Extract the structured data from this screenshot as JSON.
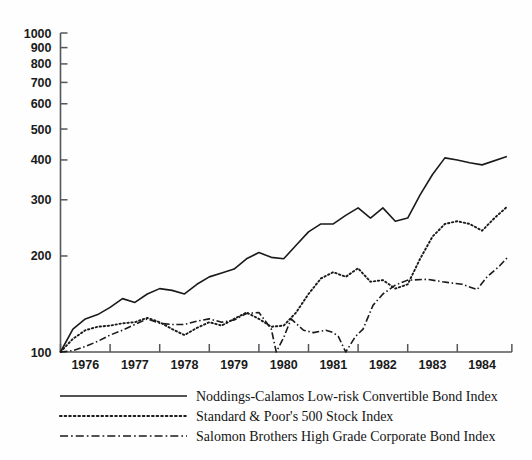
{
  "chart_data": {
    "type": "line",
    "title": "",
    "xlabel": "",
    "ylabel": "",
    "yscale": "log",
    "ylim": [
      100,
      1000
    ],
    "xlim": [
      1975.5,
      1984.6
    ],
    "grid": false,
    "legend_position": "below",
    "ytick_labels": [
      "1000",
      "900",
      "800",
      "700",
      "600",
      "500",
      "400",
      "300",
      "200",
      "100"
    ],
    "ytick_values": [
      1000,
      900,
      800,
      700,
      600,
      500,
      400,
      300,
      200,
      100
    ],
    "xtick_labels": [
      "1976",
      "1977",
      "1978",
      "1979",
      "1980",
      "1981",
      "1982",
      "1983",
      "1984"
    ],
    "xtick_values": [
      1976,
      1977,
      1978,
      1979,
      1980,
      1981,
      1982,
      1983,
      1984
    ],
    "series": [
      {
        "name": "Noddings-Calamos Low-risk Convertible Bond Index",
        "style": "solid",
        "color": "#1a1a1a",
        "points": [
          [
            1975.5,
            100
          ],
          [
            1975.75,
            118
          ],
          [
            1976.0,
            127
          ],
          [
            1976.25,
            131
          ],
          [
            1976.5,
            138
          ],
          [
            1976.75,
            147
          ],
          [
            1977.0,
            143
          ],
          [
            1977.25,
            152
          ],
          [
            1977.5,
            158
          ],
          [
            1977.75,
            156
          ],
          [
            1978.0,
            152
          ],
          [
            1978.25,
            163
          ],
          [
            1978.5,
            172
          ],
          [
            1978.75,
            177
          ],
          [
            1979.0,
            182
          ],
          [
            1979.25,
            196
          ],
          [
            1979.5,
            205
          ],
          [
            1979.75,
            198
          ],
          [
            1980.0,
            196
          ],
          [
            1980.25,
            216
          ],
          [
            1980.5,
            238
          ],
          [
            1980.75,
            252
          ],
          [
            1981.0,
            252
          ],
          [
            1981.25,
            268
          ],
          [
            1981.5,
            283
          ],
          [
            1981.75,
            263
          ],
          [
            1982.0,
            283
          ],
          [
            1982.25,
            257
          ],
          [
            1982.5,
            263
          ],
          [
            1982.75,
            311
          ],
          [
            1983.0,
            360
          ],
          [
            1983.25,
            406
          ],
          [
            1983.5,
            400
          ],
          [
            1983.75,
            392
          ],
          [
            1984.0,
            386
          ],
          [
            1984.5,
            410
          ]
        ]
      },
      {
        "name": "Standard & Poor's 500 Stock Index",
        "style": "dotted",
        "color": "#1a1a1a",
        "points": [
          [
            1975.5,
            100
          ],
          [
            1975.75,
            110
          ],
          [
            1976.0,
            117
          ],
          [
            1976.25,
            120
          ],
          [
            1976.5,
            121
          ],
          [
            1976.75,
            123
          ],
          [
            1977.0,
            124
          ],
          [
            1977.25,
            128
          ],
          [
            1977.5,
            124
          ],
          [
            1977.75,
            118
          ],
          [
            1978.0,
            113
          ],
          [
            1978.25,
            119
          ],
          [
            1978.5,
            124
          ],
          [
            1978.75,
            121
          ],
          [
            1979.0,
            127
          ],
          [
            1979.25,
            133
          ],
          [
            1979.5,
            127
          ],
          [
            1979.75,
            120
          ],
          [
            1980.0,
            121
          ],
          [
            1980.25,
            133
          ],
          [
            1980.5,
            152
          ],
          [
            1980.75,
            170
          ],
          [
            1981.0,
            178
          ],
          [
            1981.25,
            172
          ],
          [
            1981.5,
            183
          ],
          [
            1981.75,
            166
          ],
          [
            1982.0,
            168
          ],
          [
            1982.25,
            158
          ],
          [
            1982.5,
            163
          ],
          [
            1982.75,
            196
          ],
          [
            1983.0,
            230
          ],
          [
            1983.25,
            252
          ],
          [
            1983.5,
            257
          ],
          [
            1983.75,
            252
          ],
          [
            1984.0,
            240
          ],
          [
            1984.25,
            263
          ],
          [
            1984.5,
            285
          ]
        ]
      },
      {
        "name": "Salomon Brothers High Grade Corporate Bond Index",
        "style": "dashdot",
        "color": "#1a1a1a",
        "points": [
          [
            1975.5,
            100
          ],
          [
            1975.75,
            101
          ],
          [
            1976.0,
            104
          ],
          [
            1976.25,
            108
          ],
          [
            1976.5,
            113
          ],
          [
            1976.75,
            117
          ],
          [
            1977.0,
            122
          ],
          [
            1977.25,
            127
          ],
          [
            1977.5,
            123
          ],
          [
            1977.75,
            122
          ],
          [
            1978.0,
            122
          ],
          [
            1978.25,
            125
          ],
          [
            1978.5,
            127
          ],
          [
            1978.75,
            124
          ],
          [
            1979.0,
            126
          ],
          [
            1979.25,
            132
          ],
          [
            1979.5,
            133
          ],
          [
            1979.75,
            118
          ],
          [
            1979.85,
            100
          ],
          [
            1980.0,
            111
          ],
          [
            1980.15,
            127
          ],
          [
            1980.4,
            117
          ],
          [
            1980.6,
            115
          ],
          [
            1980.85,
            117
          ],
          [
            1981.0,
            115
          ],
          [
            1981.1,
            112
          ],
          [
            1981.25,
            100
          ],
          [
            1981.45,
            112
          ],
          [
            1981.6,
            118
          ],
          [
            1981.8,
            140
          ],
          [
            1982.0,
            152
          ],
          [
            1982.25,
            162
          ],
          [
            1982.5,
            168
          ],
          [
            1982.9,
            169
          ],
          [
            1983.2,
            166
          ],
          [
            1983.6,
            163
          ],
          [
            1983.9,
            157
          ],
          [
            1984.1,
            172
          ],
          [
            1984.35,
            186
          ],
          [
            1984.5,
            197
          ]
        ]
      }
    ]
  },
  "legend": {
    "items": [
      {
        "style": "solid",
        "label": "Noddings-Calamos Low-risk Convertible Bond Index"
      },
      {
        "style": "dotted",
        "label": "Standard & Poor's 500 Stock Index"
      },
      {
        "style": "dashdot",
        "label": "Salomon Brothers High Grade Corporate Bond Index"
      }
    ]
  },
  "colors": {
    "ink": "#1a1a1a",
    "axis": "#55565a",
    "background": "#fefefe"
  }
}
